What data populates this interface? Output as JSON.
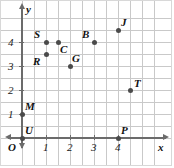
{
  "chart_data": {
    "type": "scatter",
    "title": "",
    "xlabel": "x",
    "ylabel": "y",
    "origin_label": "O",
    "xlim": [
      -0.35,
      5.5
    ],
    "ylim": [
      -0.45,
      5.2
    ],
    "grid": true,
    "grid_step": 0.5,
    "legend": "none",
    "xticks": [
      "1",
      "2",
      "3",
      "4"
    ],
    "xtick_values": [
      1,
      2,
      3,
      4
    ],
    "yticks": [
      "1",
      "2",
      "3",
      "4"
    ],
    "ytick_values": [
      1,
      2,
      3,
      4
    ],
    "points": [
      {
        "label": "S",
        "x": 1,
        "y": 4,
        "label_dx": -12,
        "label_dy": -13
      },
      {
        "label": "C",
        "x": 1.5,
        "y": 4,
        "label_dx": 2,
        "label_dy": 2
      },
      {
        "label": "R",
        "x": 1,
        "y": 3.5,
        "label_dx": -13,
        "label_dy": 2
      },
      {
        "label": "G",
        "x": 2,
        "y": 3,
        "label_dx": 2,
        "label_dy": -13
      },
      {
        "label": "B",
        "x": 3,
        "y": 4,
        "label_dx": -12,
        "label_dy": -13
      },
      {
        "label": "J",
        "x": 4,
        "y": 4.5,
        "label_dx": 3,
        "label_dy": -13
      },
      {
        "label": "T",
        "x": 4.5,
        "y": 2,
        "label_dx": 4,
        "label_dy": -12
      },
      {
        "label": "M",
        "x": 0,
        "y": 1,
        "label_dx": 3,
        "label_dy": -13
      },
      {
        "label": "U",
        "x": 0,
        "y": 0,
        "label_dx": 3,
        "label_dy": -13
      },
      {
        "label": "P",
        "x": 4,
        "y": 0,
        "label_dx": 3,
        "label_dy": -13
      }
    ],
    "colors": {
      "point": "#4a4a4a",
      "axis": "#6b6b6b",
      "grid": "#c9c9c9",
      "text": "#111111",
      "background": "#ffffff"
    }
  }
}
